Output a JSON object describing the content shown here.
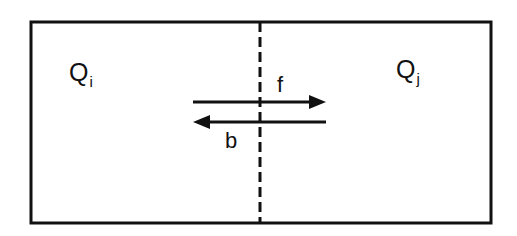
{
  "diagram": {
    "regions": [
      {
        "id": "left",
        "label": "Q",
        "subscript": "i"
      },
      {
        "id": "right",
        "label": "Q",
        "subscript": "j"
      }
    ],
    "arrows": [
      {
        "label": "f",
        "direction": "right"
      },
      {
        "label": "b",
        "direction": "left"
      }
    ],
    "divider": "dashed vertical line",
    "colors": {
      "stroke": "#111111",
      "background": "#ffffff"
    }
  }
}
